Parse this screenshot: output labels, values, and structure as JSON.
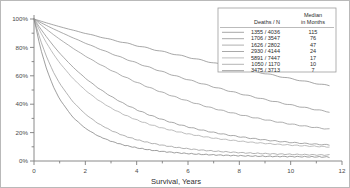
{
  "chart_data": {
    "type": "line",
    "title": "",
    "xlabel": "Survival, Years",
    "ylabel": "",
    "xlim": [
      0,
      12
    ],
    "ylim": [
      0,
      100
    ],
    "grid": false,
    "legend_position": "top-right",
    "x_ticks": [
      "0",
      "2",
      "4",
      "6",
      "8",
      "10",
      "12"
    ],
    "x_tick_values": [
      0,
      2,
      4,
      6,
      8,
      10,
      12
    ],
    "y_ticks": [
      "0%",
      "20%",
      "40%",
      "60%",
      "80%",
      "100%"
    ],
    "y_tick_values": [
      0,
      20,
      40,
      60,
      80,
      100
    ],
    "legend": {
      "col_header_1": "Deaths / N",
      "col_header_2_line1": "Median",
      "col_header_2_line2": "in Months",
      "rows": [
        {
          "deaths_n": "1355 / 4036",
          "median_months": "115"
        },
        {
          "deaths_n": "1706 / 3547",
          "median_months": "76"
        },
        {
          "deaths_n": "1626 / 2802",
          "median_months": "47"
        },
        {
          "deaths_n": "2930 / 4144",
          "median_months": "24"
        },
        {
          "deaths_n": "5891 / 7447",
          "median_months": "17"
        },
        {
          "deaths_n": "1050 / 1170",
          "median_months": "10"
        },
        {
          "deaths_n": "3475 / 3713",
          "median_months": "7"
        }
      ]
    },
    "x": [
      0,
      0.25,
      0.5,
      0.75,
      1,
      1.5,
      2,
      2.5,
      3,
      3.5,
      4,
      4.5,
      5,
      5.5,
      6,
      6.5,
      7,
      7.5,
      8,
      8.5,
      9,
      9.5,
      10,
      10.5,
      11,
      11.5
    ],
    "series": [
      {
        "name": "1355 / 4036",
        "median_months": 115,
        "color": "#8a8a8a",
        "values": [
          100,
          98.6,
          97.2,
          95.9,
          94.6,
          92.2,
          89.9,
          87.7,
          85.5,
          83.4,
          81.3,
          79.2,
          77.1,
          75.1,
          73.1,
          71.1,
          69.1,
          67.2,
          65.3,
          63.4,
          61.6,
          59.8,
          58.0,
          56.3,
          54.6,
          53.0
        ]
      },
      {
        "name": "1706 / 3547",
        "median_months": 76,
        "color": "#8f8f8f",
        "values": [
          100,
          97.6,
          95.3,
          93.1,
          91.0,
          86.9,
          83.0,
          79.3,
          75.7,
          72.3,
          69.0,
          65.9,
          62.9,
          60.0,
          57.3,
          54.7,
          52.2,
          49.8,
          47.5,
          45.4,
          43.3,
          41.4,
          39.5,
          37.8,
          36.1,
          34.6
        ]
      },
      {
        "name": "1626 / 2802",
        "median_months": 47,
        "color": "#949494",
        "values": [
          100,
          96.2,
          92.6,
          89.1,
          85.8,
          79.6,
          73.9,
          68.7,
          63.9,
          59.5,
          55.4,
          51.7,
          48.3,
          45.1,
          42.2,
          39.5,
          37.0,
          34.8,
          32.7,
          30.8,
          29.1,
          27.5,
          26.0,
          24.7,
          23.5,
          22.4
        ]
      },
      {
        "name": "2930 / 4144",
        "median_months": 24,
        "color": "#8c8c8c",
        "values": [
          100,
          93.3,
          87.1,
          81.3,
          75.9,
          66.4,
          58.3,
          51.4,
          45.5,
          40.4,
          36.1,
          32.4,
          29.2,
          26.4,
          24.0,
          21.9,
          20.1,
          18.5,
          17.1,
          15.9,
          14.8,
          13.9,
          13.1,
          12.4,
          11.8,
          11.3
        ]
      },
      {
        "name": "5891 / 7447",
        "median_months": 17,
        "color": "#a8a8a8",
        "values": [
          100,
          90.8,
          82.7,
          75.5,
          69.1,
          58.4,
          49.8,
          42.9,
          37.3,
          32.7,
          28.9,
          25.8,
          23.2,
          21.0,
          19.1,
          17.5,
          16.1,
          15.0,
          14.0,
          13.1,
          12.4,
          11.7,
          11.2,
          10.7,
          10.3,
          9.9
        ]
      },
      {
        "name": "1050 / 1170",
        "median_months": 10,
        "color": "#9a9a9a",
        "values": [
          100,
          85.1,
          72.9,
          62.8,
          54.6,
          42.0,
          33.0,
          26.4,
          21.5,
          17.8,
          15.0,
          12.8,
          11.1,
          9.7,
          8.6,
          7.7,
          7.0,
          6.4,
          5.9,
          5.5,
          5.2,
          4.9,
          4.7,
          4.5,
          4.3,
          4.2
        ]
      },
      {
        "name": "3475 / 3713",
        "median_months": 7,
        "color": "#7f7f7f",
        "values": [
          100,
          79.5,
          64.2,
          52.5,
          43.5,
          31.0,
          23.0,
          17.6,
          13.9,
          11.2,
          9.3,
          7.8,
          6.7,
          5.9,
          5.2,
          4.7,
          4.3,
          4.0,
          3.7,
          3.5,
          3.3,
          3.2,
          3.1,
          3.0,
          2.9,
          2.8
        ]
      }
    ]
  }
}
